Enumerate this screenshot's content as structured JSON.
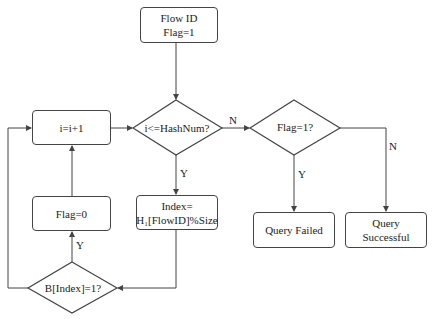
{
  "nodes": {
    "start": {
      "line1": "Flow ID",
      "line2": "Flag=1"
    },
    "check_hashnum": {
      "label": "i<=HashNum?"
    },
    "increment": {
      "label": "i=i+1"
    },
    "check_flag": {
      "label": "Flag=1?"
    },
    "query_failed": {
      "label": "Query Failed"
    },
    "query_successful": {
      "line1": "Query",
      "line2": "Successful"
    },
    "compute_index": {
      "line1": "Index=",
      "line2": "H₁[FlowID]%Size"
    },
    "set_flag_zero": {
      "label": "Flag=0"
    },
    "check_bit": {
      "label": "B[Index]=1?"
    }
  },
  "edges": {
    "hashnum_no": "N",
    "hashnum_yes": "Y",
    "flag_yes": "Y",
    "flag_no": "N",
    "bit_yes": "Y"
  },
  "colors": {
    "stroke": "#444444",
    "text": "#222222",
    "background": "#ffffff"
  }
}
